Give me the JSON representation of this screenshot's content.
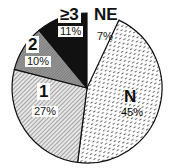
{
  "chart_data": {
    "type": "pie",
    "title": "",
    "categories": [
      "NE",
      "N",
      "1",
      "2",
      "≥3"
    ],
    "values": [
      7,
      45,
      27,
      10,
      11
    ],
    "labels": [
      "7%",
      "45%",
      "27%",
      "10%",
      "11%"
    ],
    "start_angle_deg": 0,
    "direction": "clockwise",
    "fills": [
      {
        "category": "NE",
        "pattern": "white",
        "color": "#ffffff"
      },
      {
        "category": "N",
        "pattern": "dashed-dots",
        "color": "#ffffff"
      },
      {
        "category": "1",
        "pattern": "diagonal-hatch",
        "color": "#d8d8d8"
      },
      {
        "category": "2",
        "pattern": "dense-hatch-grey",
        "color": "#8a8a8a"
      },
      {
        "category": "≥3",
        "pattern": "solid",
        "color": "#111111"
      }
    ],
    "legend": "none (labels on slices)"
  },
  "labels": {
    "ne": {
      "cat": "NE",
      "pct": "7%"
    },
    "n": {
      "cat": "N",
      "pct": "45%"
    },
    "one": {
      "cat": "1",
      "pct": "27%"
    },
    "two": {
      "cat": "2",
      "pct": "10%"
    },
    "three": {
      "cat": "≥3",
      "pct": "11%"
    }
  }
}
